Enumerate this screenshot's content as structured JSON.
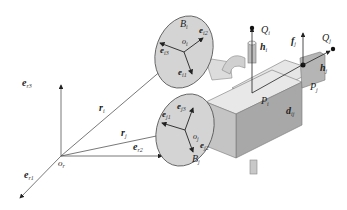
{
  "diagram": {
    "labels": {
      "er3": "e",
      "er3_sub": "r3",
      "er2": "e",
      "er2_sub": "r2",
      "er1": "e",
      "er1_sub": "r1",
      "or": "o",
      "or_sub": "r",
      "ri": "r",
      "ri_sub": "i",
      "rj": "r",
      "rj_sub": "j",
      "Bi": "B",
      "Bi_sub": "i",
      "oi": "o",
      "oi_sub": "i",
      "ei1": "e",
      "ei1_sub": "i1",
      "ei2": "e",
      "ei2_sub": "i2",
      "ei3": "e",
      "ei3_sub": "i3",
      "Bj": "B",
      "Bj_sub": "j",
      "oj": "o",
      "oj_sub": "j",
      "ej1": "e",
      "ej1_sub": "j1",
      "ej2": "e",
      "ej2_sub": "j2",
      "ej3": "e",
      "ej3_sub": "j3",
      "Qi": "Q",
      "Qi_sub": "i",
      "hi": "h",
      "hi_sub": "i",
      "Pi": "P",
      "Pi_sub": "i",
      "fj": "f",
      "fj_sub": "j",
      "Qj": "Q",
      "Qj_sub": "j",
      "hj": "h",
      "hj_sub": "j",
      "Pj": "P",
      "Pj_sub": "j",
      "dij": "d",
      "dij_sub": "ij"
    },
    "colors": {
      "disk_fill": "#d4d4d4",
      "block_top": "#e6e6e6",
      "block_front": "#bcbcbc",
      "block_side": "#9a9a9a",
      "line": "#333333"
    }
  }
}
